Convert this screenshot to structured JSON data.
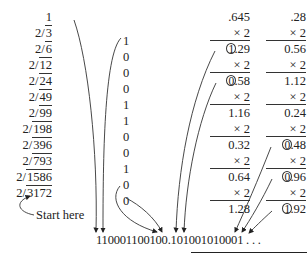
{
  "integer_part": {
    "start_value": "1",
    "divisions": [
      {
        "divisor": "2",
        "dividend": "3"
      },
      {
        "divisor": "2",
        "dividend": "6"
      },
      {
        "divisor": "2",
        "dividend": "12"
      },
      {
        "divisor": "2",
        "dividend": "24"
      },
      {
        "divisor": "2",
        "dividend": "49"
      },
      {
        "divisor": "2",
        "dividend": "99"
      },
      {
        "divisor": "2",
        "dividend": "198"
      },
      {
        "divisor": "2",
        "dividend": "396"
      },
      {
        "divisor": "2",
        "dividend": "793"
      },
      {
        "divisor": "2",
        "dividend": "1586"
      },
      {
        "divisor": "2",
        "dividend": "3172"
      }
    ],
    "remainders": [
      "1",
      "0",
      "0",
      "0",
      "1",
      "1",
      "0",
      "0",
      "1",
      "0",
      "0"
    ],
    "start_label": "Start here"
  },
  "fraction_part_1": {
    "start_value": ".645",
    "multiplier": "× 2",
    "products": [
      {
        "value": "1.29",
        "int_digit": "1",
        "rest": ".29",
        "circled": true
      },
      {
        "value": "0.58",
        "int_digit": "0",
        "rest": ".58",
        "circled": true
      },
      {
        "value": "1.16",
        "circled": false
      },
      {
        "value": "0.32",
        "circled": false
      },
      {
        "value": "0.64",
        "circled": false
      },
      {
        "value": "1.28",
        "circled": false
      }
    ]
  },
  "fraction_part_2": {
    "start_value": ".28",
    "multiplier": "× 2",
    "products": [
      {
        "value": "0.56",
        "circled": false
      },
      {
        "value": "1.12",
        "circled": false
      },
      {
        "value": "0.24",
        "circled": false
      },
      {
        "value": "0.48",
        "int_digit": "0",
        "rest": ".48",
        "circled": true
      },
      {
        "value": "0.96",
        "int_digit": "0",
        "rest": ".96",
        "circled": true
      },
      {
        "value": "1.92",
        "int_digit": "1",
        "rest": ".92",
        "circled": true
      }
    ]
  },
  "result": {
    "binary": "110001100100.101001010001 . . ."
  }
}
